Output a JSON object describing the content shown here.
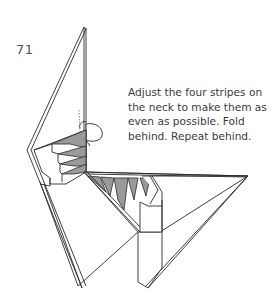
{
  "diagram": {
    "type": "origami-step",
    "step_number": "71",
    "instruction_lines": [
      "Adjust the four stripes on",
      "the neck to make them as",
      "even as possible. Fold",
      "behind. Repeat behind."
    ],
    "instruction_full": "Adjust the four stripes on the neck to make them as even as possible. Fold behind. Repeat behind.",
    "colors": {
      "line": "#2a2a2a",
      "shaded_paper": "#9a9a9a",
      "text": "#3a3a3a",
      "background": "#ffffff"
    },
    "annotations": {
      "fold_arrow": "fold-behind-arrow",
      "stripe_count": 4
    }
  }
}
